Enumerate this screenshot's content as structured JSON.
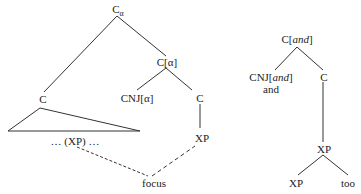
{
  "left_tree": {
    "root": {
      "base": "C",
      "subscript": "α"
    },
    "c_alpha": "C[α]",
    "c_left": "C",
    "cnj_alpha": "CNJ[α]",
    "c_right": "C",
    "xp": "XP",
    "xp_gap": "… (XP) …",
    "focus": "focus"
  },
  "right_tree": {
    "root": {
      "base": "C[",
      "italic": "and",
      "close": "]"
    },
    "cnj": {
      "base": "CNJ[",
      "italic": "and",
      "close": "]"
    },
    "cnj_word": "and",
    "c": "C",
    "xp_top": "XP",
    "xp_bottom": "XP",
    "too": "too"
  },
  "colors": {
    "line": "#333333",
    "text": "#222222",
    "background": "#ffffff"
  }
}
